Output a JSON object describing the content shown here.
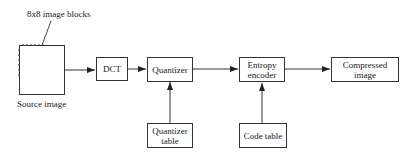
{
  "diagram": {
    "title_annotation": "8x8 image blocks",
    "nodes": {
      "source": {
        "label": "Source image"
      },
      "dct": {
        "label": "DCT"
      },
      "quantizer": {
        "label": "Quantizer"
      },
      "entropy": {
        "label": "Entropy encoder",
        "line1": "Entropy",
        "line2": "encoder"
      },
      "compressed": {
        "label": "Compressed image"
      },
      "quant_table": {
        "label": "Quantizer table",
        "line1": "Quantizer",
        "line2": "table"
      },
      "code_table": {
        "label": "Code table"
      }
    },
    "edges": [
      [
        "source",
        "dct"
      ],
      [
        "dct",
        "quantizer"
      ],
      [
        "quantizer",
        "entropy"
      ],
      [
        "entropy",
        "compressed"
      ],
      [
        "quant_table",
        "quantizer"
      ],
      [
        "code_table",
        "entropy"
      ]
    ]
  }
}
